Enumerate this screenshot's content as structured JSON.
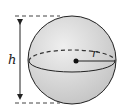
{
  "diagram": {
    "labels": {
      "height": "h",
      "radius": "r"
    },
    "colors": {
      "sphere_fill": "#d9d9d9",
      "stroke": "#222222",
      "dash": "#444444"
    }
  }
}
